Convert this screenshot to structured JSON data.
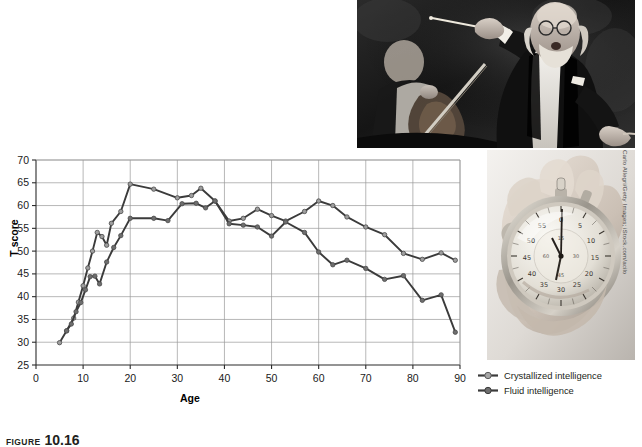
{
  "figure": {
    "caption_label": "FIGURE",
    "caption_number": "10.16",
    "credit": "Carlo Allegri/Getty Images; iStock.com/acilo"
  },
  "photos": [
    {
      "name": "conductor-photo",
      "alt": "Black and white photograph of an orchestra conductor raising a baton while a cellist plays behind him"
    },
    {
      "name": "stopwatch-photo",
      "alt": "Black and white photograph of a hand holding an analog stopwatch"
    }
  ],
  "legend": {
    "position": "bottom-right",
    "items": [
      {
        "label": "Crystallized intelligence",
        "line_color": "#3b3b3b",
        "marker_color": "#9e9e9e"
      },
      {
        "label": "Fluid intelligence",
        "line_color": "#3b3b3b",
        "marker_color": "#6e6e6e"
      }
    ]
  },
  "chart_data": {
    "type": "line",
    "title": "",
    "xlabel": "Age",
    "ylabel": "T score",
    "xlim": [
      0,
      90
    ],
    "ylim": [
      25,
      70
    ],
    "xticks": [
      0,
      10,
      20,
      30,
      40,
      50,
      60,
      70,
      80,
      90
    ],
    "yticks": [
      25,
      30,
      35,
      40,
      45,
      50,
      55,
      60,
      65,
      70
    ],
    "grid": true,
    "series": [
      {
        "name": "Crystallized intelligence",
        "color": "#3b3b3b",
        "marker_color": "#9e9e9e",
        "points": [
          [
            5,
            29.9
          ],
          [
            6.5,
            32.5
          ],
          [
            8,
            35.3
          ],
          [
            9,
            38.8
          ],
          [
            10,
            42.4
          ],
          [
            11,
            46.3
          ],
          [
            12,
            50.0
          ],
          [
            13,
            54.1
          ],
          [
            14,
            53.2
          ],
          [
            15,
            51.3
          ],
          [
            16,
            56.1
          ],
          [
            18,
            58.7
          ],
          [
            20,
            64.7
          ],
          [
            25,
            63.6
          ],
          [
            30,
            61.7
          ],
          [
            33,
            62.2
          ],
          [
            35,
            63.8
          ],
          [
            38,
            61.0
          ],
          [
            41,
            56.6
          ],
          [
            44,
            57.2
          ],
          [
            47,
            59.2
          ],
          [
            50,
            57.8
          ],
          [
            53,
            56.6
          ],
          [
            57,
            58.7
          ],
          [
            60,
            61.0
          ],
          [
            63,
            60.0
          ],
          [
            66,
            57.5
          ],
          [
            70,
            55.3
          ],
          [
            74,
            53.6
          ],
          [
            78,
            49.5
          ],
          [
            82,
            48.2
          ],
          [
            86,
            49.6
          ],
          [
            89,
            48.0
          ]
        ]
      },
      {
        "name": "Fluid intelligence",
        "color": "#3b3b3b",
        "marker_color": "#6e6e6e",
        "points": [
          [
            6.5,
            32.5
          ],
          [
            7.5,
            34.0
          ],
          [
            8.5,
            36.7
          ],
          [
            9.5,
            38.7
          ],
          [
            10.5,
            41.5
          ],
          [
            11.5,
            44.4
          ],
          [
            12.5,
            44.5
          ],
          [
            13.5,
            42.8
          ],
          [
            15,
            47.6
          ],
          [
            16.5,
            50.8
          ],
          [
            18,
            53.4
          ],
          [
            20,
            57.2
          ],
          [
            25,
            57.2
          ],
          [
            28,
            56.7
          ],
          [
            31,
            60.4
          ],
          [
            34,
            60.5
          ],
          [
            36,
            59.5
          ],
          [
            38,
            61.0
          ],
          [
            41,
            56.0
          ],
          [
            44,
            55.7
          ],
          [
            47,
            55.3
          ],
          [
            50,
            53.3
          ],
          [
            53,
            56.4
          ],
          [
            57,
            54.1
          ],
          [
            60,
            49.8
          ],
          [
            63,
            47.0
          ],
          [
            66,
            48.0
          ],
          [
            70,
            46.2
          ],
          [
            74,
            43.8
          ],
          [
            78,
            44.6
          ],
          [
            82,
            39.2
          ],
          [
            86,
            40.4
          ],
          [
            89,
            32.2
          ]
        ]
      }
    ]
  }
}
